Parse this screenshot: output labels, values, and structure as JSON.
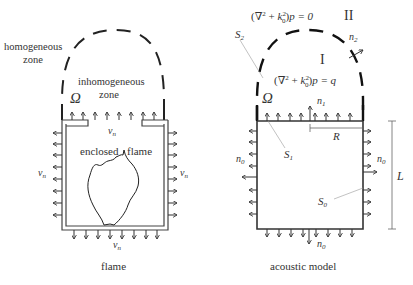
{
  "left_panel": {
    "caption": "flame",
    "labels": {
      "homogeneous_line1": "homogeneous",
      "homogeneous_line2": "zone",
      "inhomogeneous_line1": "inhomogeneous",
      "inhomogeneous_line2": "zone",
      "omega": "Ω",
      "enclosed": "enclosed",
      "flame": "flame",
      "vn_top": "v",
      "vn_left": "v",
      "vn_right": "v",
      "vn_bottom": "v",
      "vn_sub": "n"
    }
  },
  "right_panel": {
    "caption": "acoustic model",
    "labels": {
      "eq_outer": "(∇² + k₀²)p = 0",
      "eq_outer_prefix": "(∇",
      "eq_outer_suffix": "p = 0",
      "eq_inner": "(∇² + k₀²)p = q",
      "eq_inner_suffix": "p = q",
      "region_II": "II",
      "region_I": "I",
      "S2": "S",
      "S2_sub": "2",
      "S1": "S",
      "S1_sub": "1",
      "S0": "S",
      "S0_sub": "0",
      "n1": "n",
      "n1_sub": "1",
      "n2": "n",
      "n2_sub": "2",
      "n0": "n",
      "n0_sub": "0",
      "R": "R",
      "L": "L",
      "omega": "Ω"
    }
  }
}
